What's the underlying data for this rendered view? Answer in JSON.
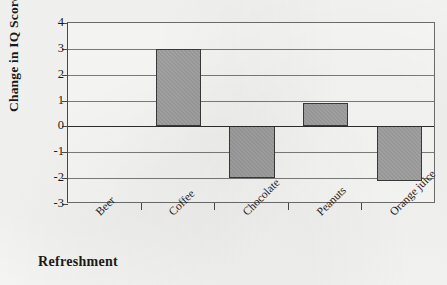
{
  "chart_data": {
    "type": "bar",
    "title": "",
    "subtitle": "",
    "xlabel": "Refreshment",
    "ylabel": "Change in IQ Score",
    "categories": [
      "Beer",
      "Coffee",
      "Chocolate",
      "Peanuts",
      "Orange juice"
    ],
    "values": [
      0,
      3,
      -2,
      0.9,
      -2.1
    ],
    "ylim": [
      -3,
      4
    ],
    "ytick_labels": [
      "4",
      "3",
      "2",
      "1",
      "0",
      "-1",
      "-2",
      "-3"
    ],
    "ytick_values": [
      4,
      3,
      2,
      1,
      0,
      -1,
      -2,
      -3
    ],
    "grid": true,
    "legend": "none",
    "bar_fill": "#9d9d9d",
    "bar_border": "#3a3a3a",
    "axis_color": "#4a4a4a",
    "gridline_color": "#7d7d7d",
    "zero_line_color": "#2e2e2e",
    "background": "#f7f7f5",
    "plot_background": "#fbfbfa",
    "category_label_rotation_deg": -45
  }
}
